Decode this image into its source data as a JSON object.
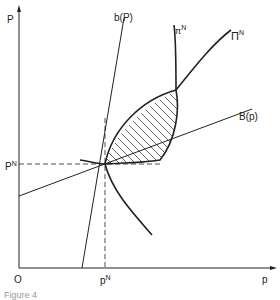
{
  "figure": {
    "axes": {
      "y_label": "P",
      "x_label": "p",
      "origin_label": "O"
    },
    "equilibrium": {
      "x_label": "p",
      "x_label_sup": "N",
      "y_label": "P",
      "y_label_sup": "N"
    },
    "curves": [
      {
        "id": "b",
        "label": "b(P)",
        "description": "steep reaction line of b"
      },
      {
        "id": "B",
        "label": "B(p)",
        "description": "shallow reaction line of B"
      },
      {
        "id": "Pi_N",
        "label": "Π",
        "label_sup": "N",
        "description": "iso-profit curve upper"
      },
      {
        "id": "pi_N",
        "label": "π",
        "label_sup": "N",
        "description": "iso-profit curve lower"
      }
    ],
    "shaded_region": "lens between Π^N and π^N curves (hatched)",
    "caption": "Figure 4"
  },
  "colors": {
    "line": "#222222",
    "background": "#ffffff"
  }
}
